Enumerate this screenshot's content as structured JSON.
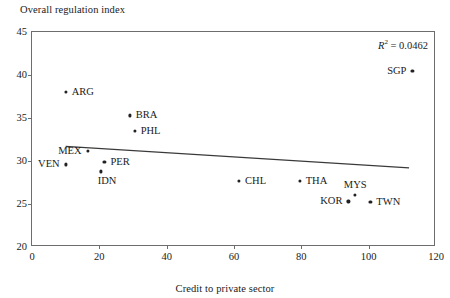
{
  "chart_data": {
    "type": "scatter",
    "title": "",
    "ylabel": "Overall regulation index",
    "xlabel": "Credit to private sector",
    "xlim": [
      0,
      120
    ],
    "ylim": [
      20,
      45
    ],
    "xticks": [
      0,
      20,
      40,
      60,
      80,
      100,
      120
    ],
    "yticks": [
      20,
      25,
      30,
      35,
      40,
      45
    ],
    "grid": false,
    "legend": null,
    "annotation": "R² = 0.0462",
    "annotation_r2_value": 0.0462,
    "points": [
      {
        "label": "ARG",
        "x": 10,
        "y": 38.0,
        "label_pos": "right"
      },
      {
        "label": "BRA",
        "x": 29,
        "y": 35.3,
        "label_pos": "right"
      },
      {
        "label": "PHL",
        "x": 30.5,
        "y": 33.5,
        "label_pos": "right"
      },
      {
        "label": "MEX",
        "x": 16.5,
        "y": 31.2,
        "label_pos": "left"
      },
      {
        "label": "VEN",
        "x": 10,
        "y": 29.6,
        "label_pos": "left"
      },
      {
        "label": "PER",
        "x": 21.5,
        "y": 29.9,
        "label_pos": "right"
      },
      {
        "label": "IDN",
        "x": 20.5,
        "y": 28.8,
        "label_pos": "below"
      },
      {
        "label": "CHL",
        "x": 61.5,
        "y": 27.7,
        "label_pos": "right"
      },
      {
        "label": "THA",
        "x": 79.5,
        "y": 27.7,
        "label_pos": "right"
      },
      {
        "label": "MYS",
        "x": 96,
        "y": 26.1,
        "label_pos": "above"
      },
      {
        "label": "KOR",
        "x": 94,
        "y": 25.3,
        "label_pos": "left"
      },
      {
        "label": "TWN",
        "x": 100.5,
        "y": 25.2,
        "label_pos": "right"
      },
      {
        "label": "SGP",
        "x": 113,
        "y": 40.5,
        "label_pos": "left"
      }
    ],
    "trendline": {
      "x_start": 10,
      "y_start": 31.7,
      "x_end": 112,
      "y_end": 29.2
    }
  },
  "colors": {
    "axis": "#6d6d6d",
    "marker": "#222222",
    "trendline": "#3a3a3a",
    "text": "#1a1a1a",
    "background": "#ffffff"
  }
}
